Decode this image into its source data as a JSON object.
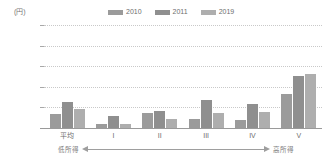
{
  "unit_label": "(円)",
  "legend": {
    "position": "top-center",
    "entries": [
      {
        "label": "2010",
        "color": "#9b9b9b"
      },
      {
        "label": "2011",
        "color": "#8f8f8f"
      },
      {
        "label": "2019",
        "color": "#aeaeae"
      }
    ]
  },
  "axis": {
    "y_ticks": [
      "25,000",
      "20,000",
      "15,000",
      "10,000",
      "5,000",
      "0"
    ],
    "y_tick_values": [
      25000,
      20000,
      15000,
      10000,
      5000,
      0
    ]
  },
  "income_axis": {
    "low_label": "低所得",
    "high_label": "高所得"
  },
  "chart_data": {
    "type": "bar",
    "title": "",
    "subtitle": "",
    "xlabel": "",
    "ylabel": "(円)",
    "ylim": [
      0,
      25000
    ],
    "ytick_step": 5000,
    "grid": true,
    "legend_position": "top-center",
    "categories": [
      "平均",
      "I",
      "II",
      "III",
      "IV",
      "V"
    ],
    "series": [
      {
        "name": "2010",
        "color": "#9b9b9b",
        "values": [
          3400,
          1000,
          3600,
          2200,
          2000,
          8200
        ]
      },
      {
        "name": "2011",
        "color": "#8f8f8f",
        "values": [
          6300,
          3000,
          4100,
          6700,
          5800,
          12700
        ]
      },
      {
        "name": "2019",
        "color": "#aeaeae",
        "values": [
          4700,
          1050,
          2200,
          3700,
          3900,
          13000
        ]
      }
    ],
    "annotations": [
      {
        "text": "低所得",
        "position": "bottom-left"
      },
      {
        "text": "高所得",
        "position": "bottom-right"
      }
    ]
  }
}
